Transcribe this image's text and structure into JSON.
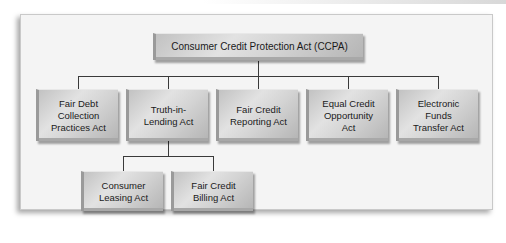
{
  "diagram": {
    "type": "hierarchy",
    "root": {
      "label": "Consumer Credit Protection Act (CCPA)"
    },
    "children": [
      {
        "label": "Fair Debt\nCollection\nPractices Act"
      },
      {
        "label": "Truth-in-\nLending Act",
        "children": [
          {
            "label": "Consumer\nLeasing Act"
          },
          {
            "label": "Fair Credit\nBilling Act"
          }
        ]
      },
      {
        "label": "Fair Credit\nReporting Act"
      },
      {
        "label": "Equal Credit\nOpportunity\nAct"
      },
      {
        "label": "Electronic\nFunds\nTransfer Act"
      }
    ]
  },
  "colors": {
    "panel_background": "#f4f4f4",
    "box_fill": "#d2d2d2",
    "connector": "#3a3a3a",
    "text": "#1a1a1a"
  }
}
